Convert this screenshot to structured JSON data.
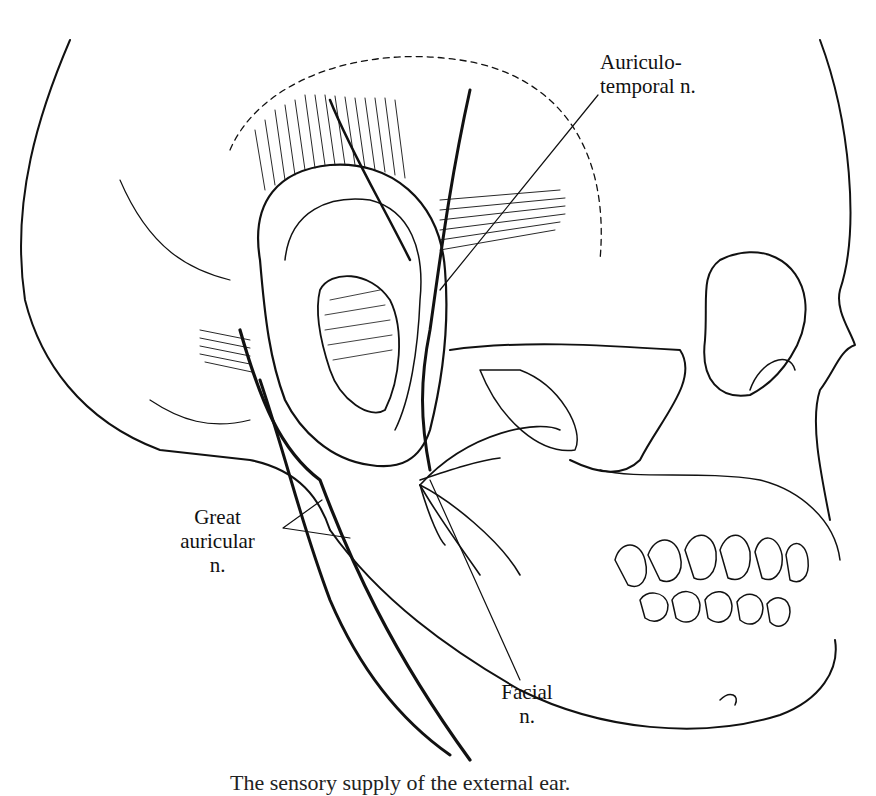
{
  "figure": {
    "labels": {
      "auriculotemporal": {
        "line1": "Auriculo-",
        "line2": "temporal n."
      },
      "great_auricular": {
        "line1": "Great",
        "line2": "auricular",
        "line3": "n."
      },
      "facial": {
        "line1": "Facial",
        "line2": "n."
      }
    },
    "caption": "The sensory supply of the external ear."
  }
}
